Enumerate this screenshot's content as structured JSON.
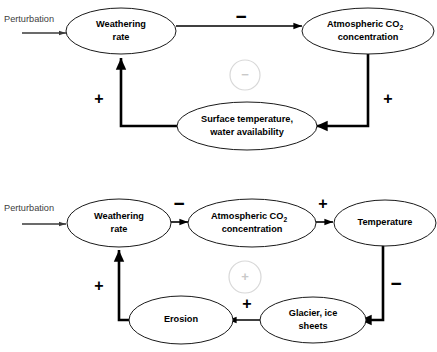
{
  "figure": {
    "type": "causal-loop-diagram-pair",
    "background_color": "#ffffff",
    "node_fill": "#ffffff",
    "node_stroke": "#1a1a1a",
    "link_color": "#000000",
    "marker_color": "#d8d8d8",
    "perturbation_color": "#404040"
  },
  "diagram_top": {
    "name": "negative-feedback-loop",
    "loop_sign": "−",
    "perturbation_label": "Perturbation",
    "nodes": [
      {
        "id": "weathering-rate",
        "label_line1": "Weathering",
        "label_line2": "rate"
      },
      {
        "id": "atmospheric-co2",
        "label_line1": "Atmospheric CO",
        "label_sub": "2",
        "label_line2": "concentration"
      },
      {
        "id": "surface-temperature",
        "label_line1": "Surface temperature,",
        "label_line2": "water availability"
      }
    ],
    "link_signs": {
      "weathering_to_co2": "−",
      "co2_to_surface": "+",
      "surface_to_weathering": "+"
    }
  },
  "diagram_bottom": {
    "name": "positive-feedback-loop",
    "loop_sign": "+",
    "perturbation_label": "Perturbation",
    "nodes": [
      {
        "id": "weathering-rate",
        "label_line1": "Weathering",
        "label_line2": "rate"
      },
      {
        "id": "atmospheric-co2",
        "label_line1": "Atmospheric CO",
        "label_sub": "2",
        "label_line2": "concentration"
      },
      {
        "id": "temperature",
        "label_line1": "Temperature"
      },
      {
        "id": "glacier-ice-sheets",
        "label_line1": "Glacier, ice",
        "label_line2": "sheets"
      },
      {
        "id": "erosion",
        "label_line1": "Erosion"
      }
    ],
    "link_signs": {
      "weathering_to_co2": "−",
      "co2_to_temperature": "+",
      "temperature_to_glacier": "−",
      "glacier_to_erosion": "+",
      "erosion_to_weathering": "+"
    }
  }
}
